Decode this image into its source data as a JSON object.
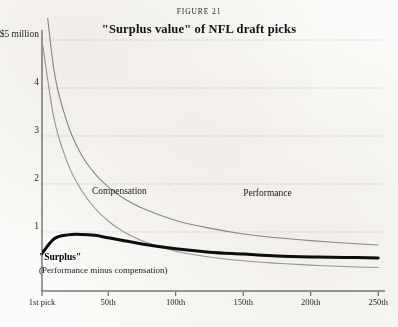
{
  "figure": {
    "label": "FIGURE 21",
    "title": "\"Surplus value\" of NFL draft picks"
  },
  "chart_data": {
    "type": "line",
    "title": "\"Surplus value\" of NFL draft picks",
    "xlabel": "",
    "ylabel": "",
    "grid": true,
    "legend": "inline-annotations",
    "xlim": [
      1,
      255
    ],
    "ylim": [
      0,
      5
    ],
    "x_ticks": [
      1,
      50,
      100,
      150,
      200,
      250
    ],
    "x_tick_labels": [
      "1st pick",
      "50th",
      "100th",
      "150th",
      "200th",
      "250th"
    ],
    "y_ticks": [
      1,
      2,
      3,
      4,
      5
    ],
    "y_tick_labels": [
      "1",
      "2",
      "3",
      "4",
      "5 million"
    ],
    "y_top_label": "$5 million",
    "y_unit": "$ millions",
    "x": [
      1,
      10,
      20,
      30,
      40,
      50,
      60,
      75,
      100,
      125,
      150,
      175,
      200,
      225,
      250
    ],
    "series": [
      {
        "name": "Performance",
        "color": "#8c8c8c",
        "width": 1.1,
        "annotation": "Performance",
        "annotation_x": 150,
        "annotation_y": 1.78,
        "values": [
          6.6,
          4.35,
          3.25,
          2.62,
          2.22,
          1.94,
          1.73,
          1.5,
          1.24,
          1.08,
          0.96,
          0.88,
          0.82,
          0.77,
          0.73
        ]
      },
      {
        "name": "Compensation",
        "color": "#9a9a9a",
        "width": 1.1,
        "annotation": "Compensation",
        "annotation_x": 38,
        "annotation_y": 1.82,
        "values": [
          5.0,
          3.35,
          2.43,
          1.88,
          1.5,
          1.23,
          1.03,
          0.82,
          0.6,
          0.48,
          0.4,
          0.35,
          0.31,
          0.28,
          0.26
        ]
      },
      {
        "name": "Surplus",
        "color": "#0d0d0d",
        "width": 3.0,
        "annotation": "\"Surplus\"",
        "annotation_sub": "(Performance minus compensation)",
        "values": [
          0.55,
          0.86,
          0.94,
          0.95,
          0.93,
          0.88,
          0.83,
          0.75,
          0.65,
          0.58,
          0.54,
          0.5,
          0.48,
          0.47,
          0.46
        ]
      }
    ]
  },
  "axis": {
    "y_labels": [
      {
        "text": "$5 million",
        "value": 5
      },
      {
        "text": "4",
        "value": 4
      },
      {
        "text": "3",
        "value": 3
      },
      {
        "text": "2",
        "value": 2
      },
      {
        "text": "1",
        "value": 1
      }
    ],
    "x_labels": [
      {
        "text": "1st pick",
        "value": 1
      },
      {
        "text": "50th",
        "value": 50
      },
      {
        "text": "100th",
        "value": 100
      },
      {
        "text": "150th",
        "value": 150
      },
      {
        "text": "200th",
        "value": 200
      },
      {
        "text": "250th",
        "value": 250
      }
    ]
  },
  "annotations": {
    "compensation": "Compensation",
    "performance": "Performance",
    "surplus": "\"Surplus\"",
    "surplus_sub": "(Performance minus compensation)"
  },
  "colors": {
    "performance": "#8c8c8c",
    "compensation": "#9a9a9a",
    "surplus": "#0d0d0d",
    "grid": "#9d9d9d",
    "axis": "#3a3a3a",
    "paper": "#fbfaf8"
  }
}
